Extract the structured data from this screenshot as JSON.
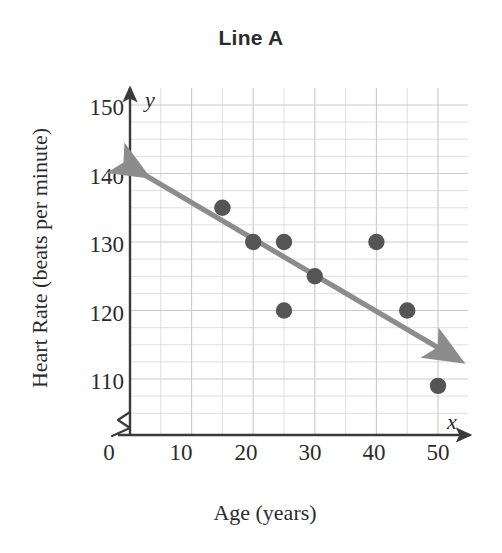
{
  "chart_data": {
    "type": "scatter",
    "title": "Line A",
    "xlabel": "Age (years)",
    "ylabel": "Heart Rate (beats per minute)",
    "xlim": [
      0,
      55
    ],
    "ylim": [
      105,
      152.5
    ],
    "y_axis_broken": true,
    "grid": true,
    "x_ticks": [
      "0",
      "10",
      "20",
      "30",
      "40",
      "50"
    ],
    "x_tick_values": [
      0,
      10,
      20,
      30,
      40,
      50
    ],
    "y_ticks": [
      "110",
      "120",
      "130",
      "140",
      "150"
    ],
    "y_tick_values": [
      110,
      120,
      130,
      140,
      150
    ],
    "x_minor_step": 5,
    "y_minor_step": 2.5,
    "point_color": "#555555",
    "line_color": "#8c8c8c",
    "axis_color": "#3a3a3a",
    "grid_color": "#c9c9c9",
    "series": [
      {
        "name": "Heart Rate vs Age",
        "points": [
          {
            "x": 15,
            "y": 135
          },
          {
            "x": 20,
            "y": 130
          },
          {
            "x": 25,
            "y": 130
          },
          {
            "x": 25,
            "y": 120
          },
          {
            "x": 30,
            "y": 125
          },
          {
            "x": 40,
            "y": 130
          },
          {
            "x": 45,
            "y": 120
          },
          {
            "x": 50,
            "y": 109
          }
        ]
      }
    ],
    "trend_line": {
      "label": "Line A",
      "x1": 2,
      "y1": 140,
      "x2": 53,
      "y2": 113,
      "double_arrow": true
    },
    "axis_symbols": {
      "y_axis_variable": "y",
      "x_axis_variable": "x"
    }
  }
}
